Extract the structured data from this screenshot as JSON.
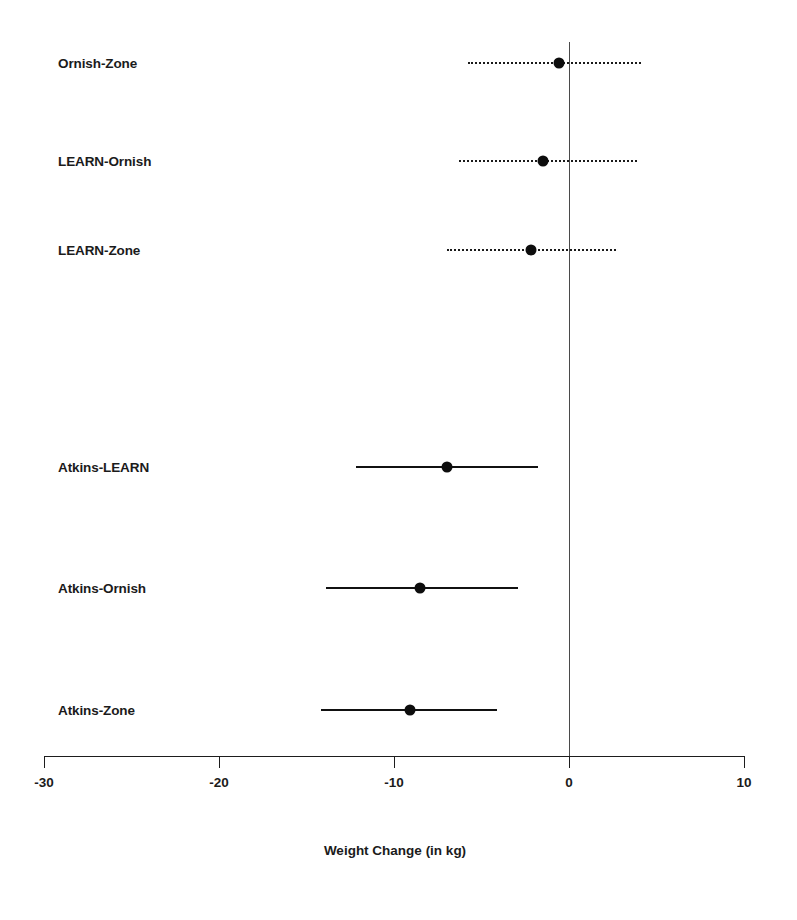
{
  "chart_data": {
    "type": "scatter",
    "subtype": "forest-plot-confidence-intervals",
    "title": "",
    "xlabel": "Weight Change (in kg)",
    "ylabel": "",
    "xlim": [
      -30,
      10
    ],
    "xticks": [
      -30,
      -20,
      -10,
      0,
      10
    ],
    "xticklabels": [
      "-30",
      "-20",
      "-10",
      "0",
      "10"
    ],
    "grid": false,
    "legend": false,
    "reference_line": 0,
    "categories": [
      "Ornish-Zone",
      "LEARN-Ornish",
      "LEARN-Zone",
      "Atkins-LEARN",
      "Atkins-Ornish",
      "Atkins-Zone"
    ],
    "points": [
      {
        "label": "Ornish-Zone",
        "estimate": -0.6,
        "ci_lower": -5.8,
        "ci_upper": 4.1,
        "line_style": "dotted",
        "significant": false
      },
      {
        "label": "LEARN-Ornish",
        "estimate": -1.5,
        "ci_lower": -6.3,
        "ci_upper": 3.9,
        "line_style": "dotted",
        "significant": false
      },
      {
        "label": "LEARN-Zone",
        "estimate": -2.2,
        "ci_lower": -7.0,
        "ci_upper": 2.7,
        "line_style": "dotted",
        "significant": false
      },
      {
        "label": "Atkins-LEARN",
        "estimate": -7.0,
        "ci_lower": -12.2,
        "ci_upper": -1.8,
        "line_style": "solid",
        "significant": true
      },
      {
        "label": "Atkins-Ornish",
        "estimate": -8.5,
        "ci_lower": -13.9,
        "ci_upper": -2.9,
        "line_style": "solid",
        "significant": true
      },
      {
        "label": "Atkins-Zone",
        "estimate": -9.1,
        "ci_lower": -14.2,
        "ci_upper": -4.1,
        "line_style": "solid",
        "significant": true
      }
    ],
    "colors": {
      "point": "#0d0d0d",
      "line": "#111111",
      "axis": "#1d1d1d",
      "reference": "#4a4a4a",
      "background": "#ffffff",
      "text": "#1b1b1b"
    }
  },
  "layout": {
    "plot_left_px": 44,
    "plot_right_px": 744,
    "axis_y_px": 756,
    "row_y_px": [
      63,
      161,
      250,
      467,
      588,
      710
    ],
    "zero_line_top_px": 42,
    "tick_length_px": 12,
    "tick_label_y_px": 775,
    "axis_title_y_px": 843,
    "axis_title_center_px": 395,
    "label_left_px": 58
  }
}
